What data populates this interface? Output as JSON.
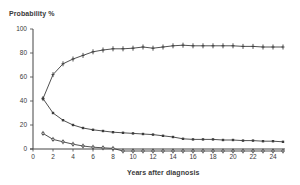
{
  "chart_data": {
    "type": "line",
    "title": "",
    "xlabel": "Years after diagnosis",
    "ylabel": "Probability %",
    "xlim": [
      0,
      25
    ],
    "ylim": [
      0,
      100
    ],
    "x_ticks": [
      0,
      2,
      4,
      6,
      8,
      10,
      12,
      14,
      16,
      18,
      20,
      22,
      24
    ],
    "y_ticks": [
      0,
      20,
      40,
      60,
      80,
      100
    ],
    "grid": false,
    "legend": null,
    "x": [
      1,
      2,
      3,
      4,
      5,
      6,
      7,
      8,
      9,
      10,
      11,
      12,
      13,
      14,
      15,
      16,
      17,
      18,
      19,
      20,
      21,
      22,
      23,
      24,
      25
    ],
    "series": [
      {
        "name": "upper",
        "marker": "plus",
        "values": [
          42,
          62,
          71,
          75,
          78,
          81,
          82.5,
          83.5,
          83.5,
          84,
          85,
          84,
          85,
          86,
          86.5,
          86,
          86,
          86,
          86,
          86,
          85.5,
          85.5,
          85,
          85,
          85
        ]
      },
      {
        "name": "middle",
        "marker": "square",
        "values": [
          42,
          30,
          24,
          20,
          17.5,
          16,
          15,
          14,
          13.5,
          13,
          12.5,
          12,
          11,
          10,
          8.5,
          8,
          8,
          8,
          7.5,
          7.5,
          7,
          7,
          6.5,
          6.5,
          6
        ]
      },
      {
        "name": "lower",
        "marker": "circle",
        "values": [
          13,
          8,
          6,
          4,
          2.5,
          1.5,
          1,
          0.5,
          0,
          0,
          0,
          0,
          0,
          0,
          0,
          0,
          0,
          0,
          0,
          0,
          0,
          0,
          0,
          0,
          0
        ]
      }
    ]
  },
  "labels": {
    "ylabel": "Probability %",
    "xlabel": "Years after diagnosis"
  },
  "style": {
    "line_color": "#3c3c3c",
    "axis_color": "#444444",
    "text_color": "#3a3a3a"
  }
}
